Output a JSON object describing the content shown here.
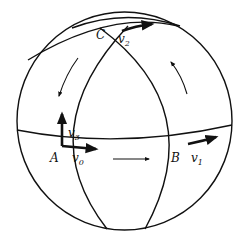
{
  "figure": {
    "stroke_color": "#111111",
    "background": "#ffffff"
  },
  "points": [
    {
      "name": "A",
      "x": 50,
      "y": 155
    },
    {
      "name": "B",
      "x": 170,
      "y": 155
    },
    {
      "name": "C",
      "x": 96,
      "y": 32
    }
  ],
  "vectors": [
    {
      "name": "v",
      "sub": "0",
      "x": 71,
      "y": 155
    },
    {
      "name": "v",
      "sub": "1",
      "x": 190,
      "y": 155
    },
    {
      "name": "v",
      "sub": "2",
      "x": 118,
      "y": 36
    },
    {
      "name": "v",
      "sub": "3",
      "x": 68,
      "y": 130
    }
  ],
  "arrows": [
    {
      "id": "path-A-to-B",
      "direction": "right"
    },
    {
      "id": "path-B-to-C",
      "direction": "up-left"
    },
    {
      "id": "path-C-to-A",
      "direction": "down-left"
    }
  ]
}
